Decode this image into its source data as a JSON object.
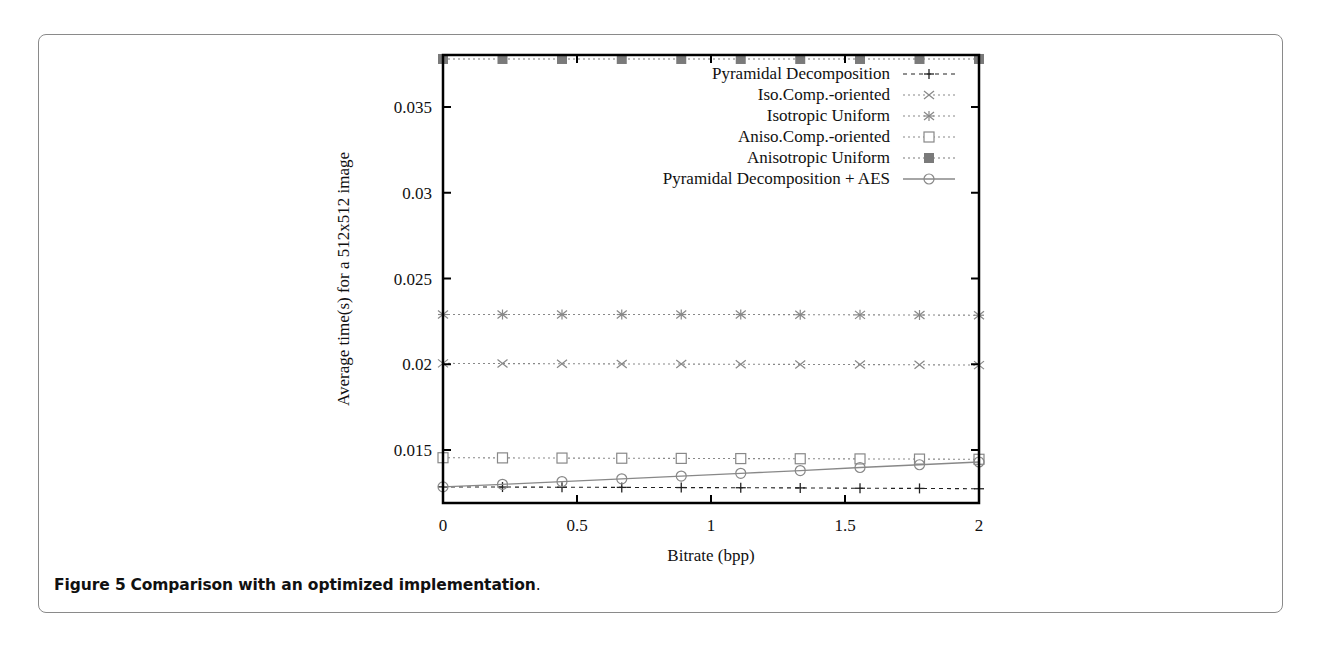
{
  "caption": {
    "label": "Figure 5",
    "text": "Comparison with an optimized implementation",
    "period": "."
  },
  "chart_data": {
    "type": "line",
    "title": "",
    "xlabel": "Bitrate (bpp)",
    "ylabel": "Average time(s) for a 512x512 image",
    "xlim": [
      0,
      2
    ],
    "ylim": [
      0.0119,
      0.038
    ],
    "xticks": [
      0,
      0.5,
      1,
      1.5,
      2
    ],
    "xtick_labels": [
      "0",
      "0.5",
      "1",
      "1.5",
      "2"
    ],
    "yticks": [
      0.015,
      0.02,
      0.025,
      0.03,
      0.035
    ],
    "ytick_labels": [
      "0.015",
      "0.02",
      "0.025",
      "0.03",
      "0.035"
    ],
    "grid": false,
    "legend_position": "upper right",
    "x": [
      0,
      0.222,
      0.444,
      0.667,
      0.889,
      1.111,
      1.333,
      1.556,
      1.778,
      2.0
    ],
    "series": [
      {
        "name": "Pyramidal Decomposition",
        "marker": "plus",
        "line": "dashed",
        "color": "#222222",
        "values": [
          0.01285,
          0.01284,
          0.01283,
          0.01282,
          0.01281,
          0.0128,
          0.01279,
          0.01277,
          0.01276,
          0.01274
        ]
      },
      {
        "name": "Iso.Comp.-oriented",
        "marker": "x",
        "line": "dotted",
        "color": "#888888",
        "values": [
          0.02005,
          0.02004,
          0.02003,
          0.02002,
          0.02001,
          0.02,
          0.01999,
          0.01998,
          0.01997,
          0.01995
        ]
      },
      {
        "name": "Isotropic Uniform",
        "marker": "star",
        "line": "dotted",
        "color": "#888888",
        "values": [
          0.0229,
          0.0229,
          0.0229,
          0.0229,
          0.0229,
          0.0229,
          0.02289,
          0.02288,
          0.02287,
          0.02286
        ]
      },
      {
        "name": "Aniso.Comp.-oriented",
        "marker": "open-square",
        "line": "dotted",
        "color": "#888888",
        "values": [
          0.01455,
          0.01454,
          0.01453,
          0.01452,
          0.01451,
          0.0145,
          0.01449,
          0.01448,
          0.01447,
          0.01446
        ]
      },
      {
        "name": "Anisotropic Uniform",
        "marker": "filled-square",
        "line": "dotted",
        "color": "#7a7a7a",
        "values": [
          0.0378,
          0.0378,
          0.0378,
          0.0378,
          0.0378,
          0.0378,
          0.0378,
          0.0378,
          0.0378,
          0.0378
        ]
      },
      {
        "name": "Pyramidal Decomposition + AES",
        "marker": "open-circle",
        "line": "solid",
        "color": "#888888",
        "values": [
          0.01285,
          0.013,
          0.01316,
          0.01332,
          0.01348,
          0.01364,
          0.0138,
          0.01398,
          0.01414,
          0.0143
        ]
      }
    ]
  }
}
